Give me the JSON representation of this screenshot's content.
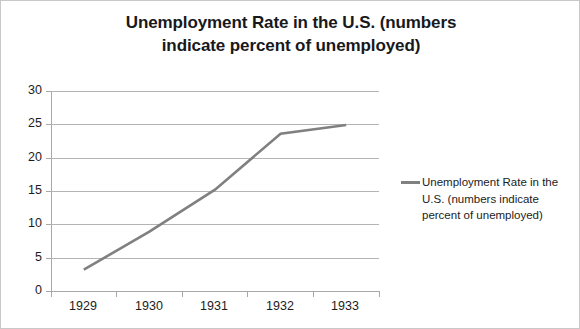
{
  "chart_data": {
    "type": "line",
    "title": "Unemployment Rate in the U.S. (numbers indicate percent of unemployed)",
    "title_lines": [
      "Unemployment Rate in the U.S. (numbers",
      "indicate percent of unemployed)"
    ],
    "xlabel": "",
    "ylabel": "",
    "categories": [
      "1929",
      "1930",
      "1931",
      "1932",
      "1933"
    ],
    "series": [
      {
        "name": "Unemployment Rate in the U.S. (numbers indicate percent of unemployed)",
        "name_lines": [
          "Unemployment Rate in the",
          "U.S. (numbers indicate",
          "percent of unemployed)"
        ],
        "values": [
          3.2,
          8.9,
          15.2,
          23.6,
          24.9
        ],
        "color": "#808080"
      }
    ],
    "ylim": [
      0,
      30
    ],
    "ytick_step": 5,
    "yticks": [
      "30",
      "25",
      "20",
      "15",
      "10",
      "5",
      "0"
    ],
    "grid": "horizontal",
    "legend_position": "right",
    "axis_color": "#a8a8a8",
    "grid_color": "#b4b4b4",
    "text_color": "#1c1c1c",
    "title_color": "#17191c",
    "background": "#ffffff"
  }
}
